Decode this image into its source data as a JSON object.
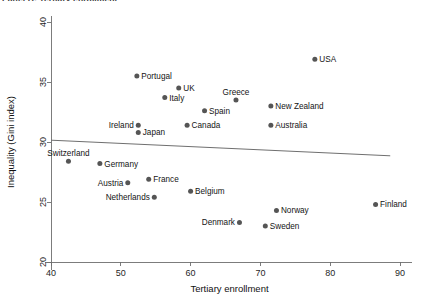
{
  "top_caption": "Panel B: Tertiary enrollment",
  "chart_data": {
    "type": "scatter",
    "title": "",
    "xlabel": "Tertiary enrollment",
    "ylabel": "Inequality (Gini index)",
    "xlim": [
      40,
      90
    ],
    "ylim": [
      20,
      40
    ],
    "xticks": [
      40,
      50,
      60,
      70,
      80,
      90
    ],
    "yticks": [
      20,
      25,
      30,
      35,
      40
    ],
    "grid": false,
    "legend": "none",
    "point_color": "#555555",
    "fitline_color": "#6f6f6f",
    "fitline": {
      "label": "linear fit",
      "x": [
        40,
        88.6
      ],
      "y": [
        30.15,
        28.85
      ]
    },
    "points": [
      {
        "label": "Switzerland",
        "x": 42.5,
        "y": 28.4,
        "label_pos": "above"
      },
      {
        "label": "Germany",
        "x": 47.0,
        "y": 28.2,
        "label_pos": "right"
      },
      {
        "label": "Austria",
        "x": 51.0,
        "y": 26.6,
        "label_pos": "left"
      },
      {
        "label": "Portugal",
        "x": 52.3,
        "y": 35.5,
        "label_pos": "right"
      },
      {
        "label": "Ireland",
        "x": 52.5,
        "y": 31.4,
        "label_pos": "left"
      },
      {
        "label": "Japan",
        "x": 52.5,
        "y": 30.8,
        "label_pos": "right"
      },
      {
        "label": "France",
        "x": 54.0,
        "y": 26.9,
        "label_pos": "right"
      },
      {
        "label": "Netherlands",
        "x": 54.8,
        "y": 25.4,
        "label_pos": "left"
      },
      {
        "label": "Italy",
        "x": 56.3,
        "y": 33.7,
        "label_pos": "right"
      },
      {
        "label": "UK",
        "x": 58.3,
        "y": 34.5,
        "label_pos": "right"
      },
      {
        "label": "Canada",
        "x": 59.5,
        "y": 31.4,
        "label_pos": "right"
      },
      {
        "label": "Belgium",
        "x": 60.0,
        "y": 25.9,
        "label_pos": "right"
      },
      {
        "label": "Spain",
        "x": 62.0,
        "y": 32.6,
        "label_pos": "right"
      },
      {
        "label": "Greece",
        "x": 66.5,
        "y": 33.5,
        "label_pos": "above"
      },
      {
        "label": "Denmark",
        "x": 67.0,
        "y": 23.3,
        "label_pos": "left"
      },
      {
        "label": "Sweden",
        "x": 70.7,
        "y": 23.0,
        "label_pos": "right"
      },
      {
        "label": "New Zealand",
        "x": 71.5,
        "y": 33.0,
        "label_pos": "right"
      },
      {
        "label": "Australia",
        "x": 71.5,
        "y": 31.4,
        "label_pos": "right"
      },
      {
        "label": "Norway",
        "x": 72.3,
        "y": 24.3,
        "label_pos": "right"
      },
      {
        "label": "USA",
        "x": 77.8,
        "y": 36.9,
        "label_pos": "right"
      },
      {
        "label": "Finland",
        "x": 86.5,
        "y": 24.8,
        "label_pos": "right"
      }
    ]
  }
}
